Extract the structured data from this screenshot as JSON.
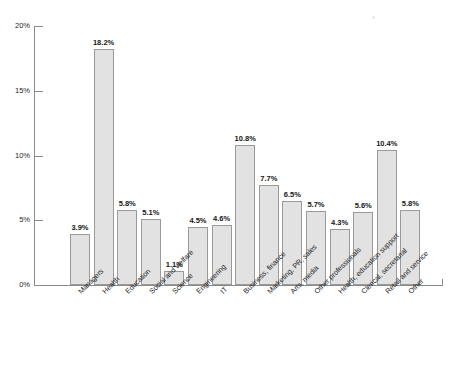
{
  "chart_data": {
    "type": "bar",
    "title": "",
    "subtitle": "",
    "xlabel": "",
    "ylabel": "",
    "ylim": [
      0,
      20
    ],
    "grid": false,
    "legend": null,
    "value_suffix": "%",
    "axis_color": "#8a8a8a",
    "bar_fill": "#e2e2e2",
    "bar_stroke": "#9a9a9a",
    "text_color": "#1f1f1f",
    "background": "#ffffff",
    "ytick_labels": [
      "20%",
      "15%",
      "10%",
      "5%",
      "0%"
    ],
    "ytick_values": [
      20,
      15,
      10,
      5,
      0
    ],
    "categories": [
      "Managers",
      "Health",
      "Education",
      "Social and welfare",
      "Science",
      "Engineering",
      "IT",
      "Business, finance",
      "Marketing, PR, sales",
      "Arts, media",
      "Other professionals",
      "Health, education support",
      "Clerical, secretarial",
      "Retail and service",
      "Other"
    ],
    "values": [
      3.9,
      18.2,
      5.8,
      5.1,
      1.1,
      4.5,
      4.6,
      10.8,
      7.7,
      6.5,
      5.7,
      4.3,
      5.6,
      10.4,
      5.8
    ],
    "data_labels": [
      "3.9%",
      "18.2%",
      "5.8%",
      "5.1%",
      "1.1%",
      "4.5%",
      "4.6%",
      "10.8%",
      "7.7%",
      "6.5%",
      "5.7%",
      "4.3%",
      "5.6%",
      "10.4%",
      "5.8%"
    ]
  }
}
